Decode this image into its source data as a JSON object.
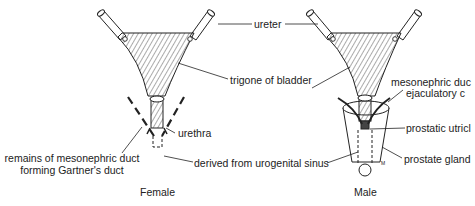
{
  "female": {
    "caption": "Female",
    "labels": {
      "trigone": "trigone of bladder",
      "urethra": "urethra",
      "remains_line1": "remains of mesonephric duct",
      "remains_line2": "forming Gartner's duct",
      "derived": "derived from urogenital sinus"
    }
  },
  "shared": {
    "ureter": "ureter"
  },
  "male": {
    "caption": "Male",
    "labels": {
      "mesonephric_line1": "mesonephric duc",
      "mesonephric_line2": "ejaculatory c",
      "prostatic_utricle": "prostatic utricl",
      "prostate_gland": "prostate gland",
      "prostate_marker": "M"
    }
  },
  "colors": {
    "line": "#222222",
    "hatch": "#444444",
    "background": "#ffffff"
  }
}
